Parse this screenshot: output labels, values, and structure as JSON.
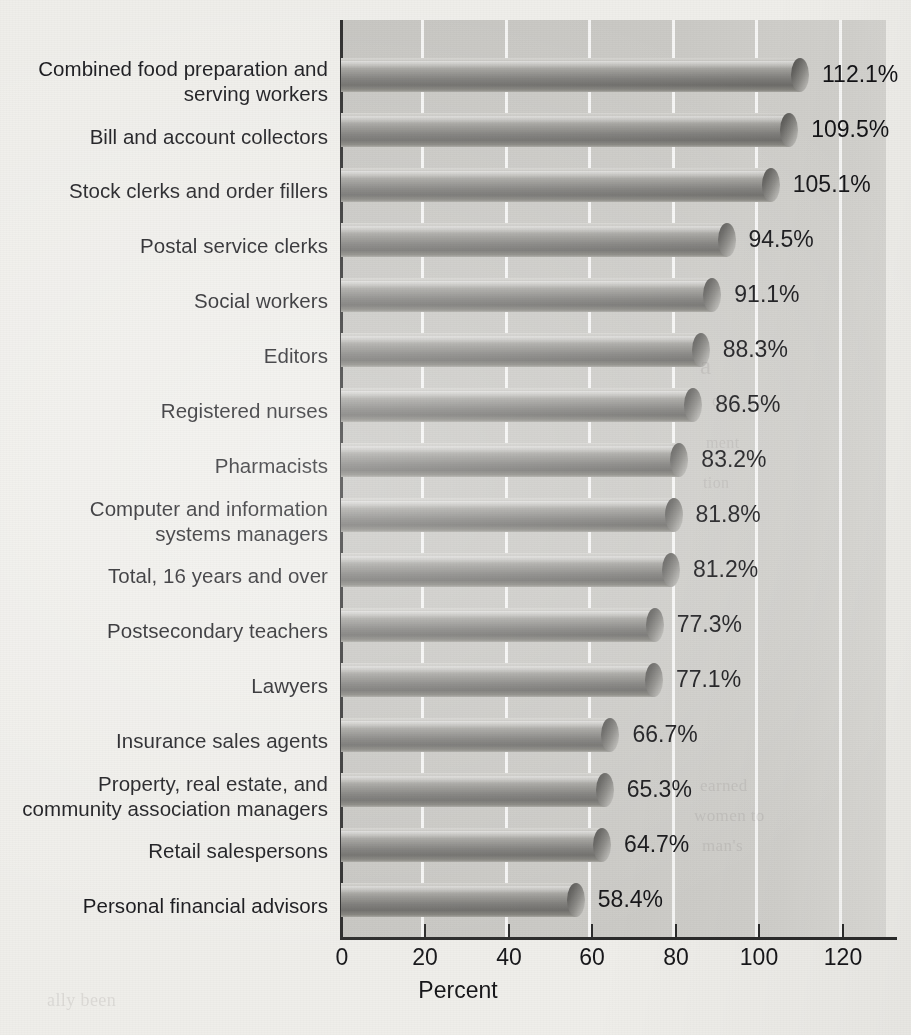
{
  "chart_data": {
    "type": "bar",
    "orientation": "horizontal",
    "title": "",
    "xlabel": "Percent",
    "ylabel": "",
    "xlim": [
      0,
      130
    ],
    "xticks": [
      0,
      20,
      40,
      60,
      80,
      100,
      120
    ],
    "xtick_labels": [
      "0",
      "20",
      "40",
      "60",
      "80",
      "100",
      "120"
    ],
    "grid": "vertical-white",
    "legend": "none",
    "value_suffix": "%",
    "categories": [
      "Combined food preparation and\nserving workers",
      "Bill and account collectors",
      "Stock clerks and order fillers",
      "Postal service clerks",
      "Social workers",
      "Editors",
      "Registered nurses",
      "Pharmacists",
      "Computer and information\nsystems managers",
      "Total, 16 years and over",
      "Postsecondary teachers",
      "Lawyers",
      "Insurance sales agents",
      "Property, real estate, and\ncommunity association managers",
      "Retail salespersons",
      "Personal financial advisors"
    ],
    "values": [
      112.1,
      109.5,
      105.1,
      94.5,
      91.1,
      88.3,
      86.5,
      83.2,
      81.8,
      81.2,
      77.3,
      77.1,
      66.7,
      65.3,
      64.7,
      58.4
    ],
    "value_labels": [
      "112.1%",
      "109.5%",
      "105.1%",
      "94.5%",
      "91.1%",
      "88.3%",
      "86.5%",
      "83.2%",
      "81.8%",
      "81.2%",
      "77.3%",
      "77.1%",
      "66.7%",
      "65.3%",
      "64.7%",
      "58.4%"
    ]
  },
  "axis": {
    "x_title": "Percent"
  },
  "colors": {
    "page_background": "#efeeea",
    "plot_background": "#c9c8c4",
    "gridline": "#ffffff",
    "axis_line": "#2b2b2b",
    "text": "#16161a",
    "bar_light": "#d7d6d2",
    "bar_dark": "#6d6c69"
  },
  "ghost_text": [
    "a",
    "of",
    "ment",
    "tion",
    "earned",
    "women to",
    "man's",
    "ally been"
  ]
}
